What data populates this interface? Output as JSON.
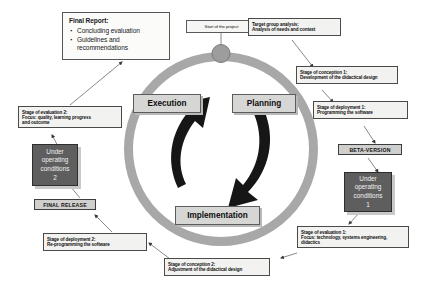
{
  "diagram": {
    "colors": {
      "ring": "#a8a8a8",
      "phase_box": "#d6d6d4",
      "dark_box": "#5e5e5e",
      "release_banner": "#cfcfcd",
      "note_box": "#f2f2f0",
      "connector": "#6b6b6b"
    }
  },
  "start_node": {
    "label": "Start of the project"
  },
  "final_report": {
    "title": "Final Report:",
    "bullets": [
      "Concluding evaluation",
      "Guidelines and",
      "recommendations"
    ],
    "bullet_1": "Concluding evaluation",
    "bullet_2": "Guidelines and",
    "bullet_3": "recommendations"
  },
  "phases": {
    "planning": "Planning",
    "execution": "Execution",
    "implementation": "Implementation"
  },
  "notes": {
    "target_group": {
      "line1": "Target group analysis:",
      "line2": "Analysis of needs  and context"
    },
    "conception_1": {
      "line1": "Stage of conception 1:",
      "line2": "Development of the didactical design"
    },
    "deployment_1": {
      "line1": "Stage of deployment 1:",
      "line2": "Programming  the software"
    },
    "evaluation_1": {
      "line1": "Stage of evaluation 1:",
      "line2": "Focus: technology, systems engineering,",
      "line3": "didactics"
    },
    "conception_2": {
      "line1": "Stage of conception 2:",
      "line2": "Adjustment of the didactical design"
    },
    "deployment_2": {
      "line1": "Stage of deployment 2:",
      "line2": "Re-programming the software"
    },
    "evaluation_2": {
      "line1": "Stage of evaluation 2:",
      "line2": "Focus: quality, learning progress",
      "line3": "and outcome"
    }
  },
  "artifacts": {
    "beta_version": "BETA-VERSION",
    "final_release": "FINAL RELEASE",
    "under_operating_1": {
      "line1": "Under",
      "line2": "operating",
      "line3": "conditions",
      "line4": "1"
    },
    "under_operating_2": {
      "line1": "Under",
      "line2": "operating",
      "line3": "conditions",
      "line4": "2"
    }
  }
}
